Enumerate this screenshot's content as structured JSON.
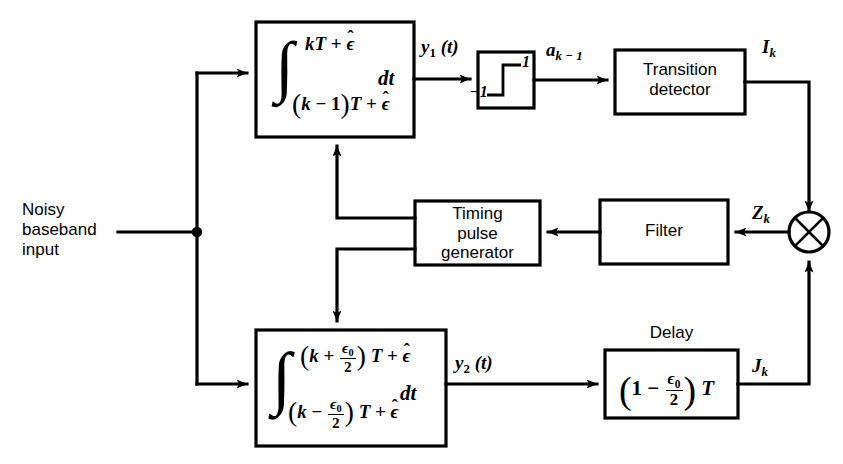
{
  "diagram": {
    "line_color": "#000000",
    "background": "#ffffff",
    "input": {
      "label_line1": "Noisy",
      "label_line2": "baseband",
      "label_line3": "input"
    },
    "blocks": {
      "top_integrator": {
        "name": "top-integrator",
        "integral_upper_limit": "kT + ε̂",
        "integral_lower_limit": "(k − 1)T + ε̂",
        "differential": "dt",
        "upper_k": "k",
        "upper_T": "T",
        "upper_plus": "+",
        "upper_eps": "ϵ",
        "lower_open": "(",
        "lower_k": "k",
        "lower_minus": "−",
        "lower_one": "1",
        "lower_close": ")",
        "lower_T": "T",
        "lower_plus": "+",
        "lower_eps": "ϵ"
      },
      "bottom_integrator": {
        "name": "bottom-integrator",
        "integral_upper_limit": "(k + ε₀/2)T + ε̂",
        "integral_lower_limit": "(k − ε₀/2)T + ε̂",
        "differential": "dt",
        "k": "k",
        "plus": "+",
        "minus": "−",
        "eps_num": "ϵ",
        "eps_sub": "0",
        "den": "2",
        "T": "T",
        "eps_hat": "ϵ"
      },
      "limiter": {
        "name": "sign-limiter",
        "upper_level": "1",
        "lower_level": "−1"
      },
      "transition_detector": {
        "line1": "Transition",
        "line2": "detector"
      },
      "timing_pulse_generator": {
        "line1": "Timing",
        "line2": "pulse",
        "line3": "generator"
      },
      "filter": {
        "label": "Filter"
      },
      "delay": {
        "caption": "Delay",
        "open_paren": "(",
        "one": "1",
        "minus": "−",
        "eps_num": "ϵ",
        "eps_sub": "0",
        "den": "2",
        "close_paren": ")",
        "T": "T"
      },
      "multiplier": {
        "name": "multiplier",
        "glyph": "⊗"
      }
    },
    "signals": {
      "y1": {
        "base": "y",
        "sub": "1",
        "arg": "(t)"
      },
      "y2": {
        "base": "y",
        "sub": "2",
        "arg": "(t)"
      },
      "a_k_minus_1": {
        "base": "a",
        "sub": "k − 1"
      },
      "I_k": {
        "base": "I",
        "sub": "k"
      },
      "J_k": {
        "base": "J",
        "sub": "k"
      },
      "Z_k": {
        "base": "Z",
        "sub": "k"
      }
    }
  }
}
